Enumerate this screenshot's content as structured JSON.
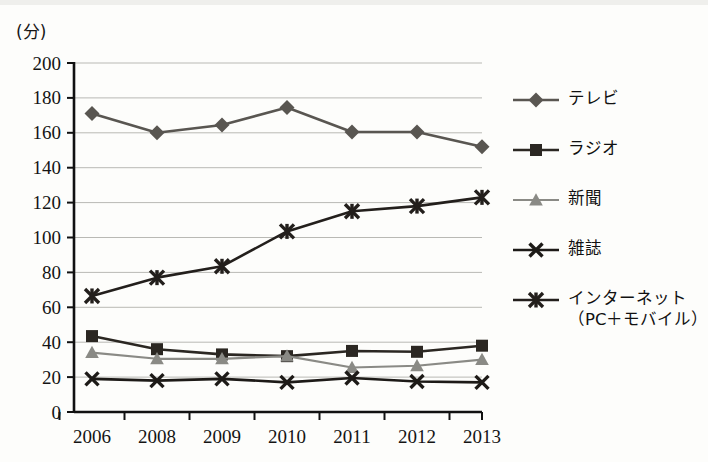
{
  "axis_unit_label": "(分)",
  "legend": {
    "items": [
      {
        "label": "テレビ",
        "sub_label": "",
        "marker": "diamond",
        "color": "#595651"
      },
      {
        "label": "ラジオ",
        "sub_label": "",
        "marker": "square",
        "color": "#2b2722"
      },
      {
        "label": "新聞",
        "sub_label": "",
        "marker": "triangle",
        "color": "#8a8a85"
      },
      {
        "label": "雑誌",
        "sub_label": "",
        "marker": "x-cross",
        "color": "#1d1a17"
      },
      {
        "label": "インターネット",
        "sub_label": "（PC＋モバイル）",
        "marker": "star-cross",
        "color": "#231f1c"
      }
    ]
  },
  "chart_data": {
    "type": "line",
    "title": "",
    "xlabel": "",
    "ylabel": "(分)",
    "categories": [
      "2006",
      "2008",
      "2009",
      "2010",
      "2011",
      "2012",
      "2013"
    ],
    "ylim": [
      0,
      200
    ],
    "ytick_step": 20,
    "yticks": [
      0,
      20,
      40,
      60,
      80,
      100,
      120,
      140,
      160,
      180,
      200
    ],
    "grid": true,
    "legend_position": "right",
    "series": [
      {
        "name": "テレビ",
        "color": "#595651",
        "marker": "diamond",
        "values": [
          171,
          160,
          164.5,
          174.5,
          160.5,
          160.5,
          152
        ]
      },
      {
        "name": "ラジオ",
        "color": "#2b2722",
        "marker": "square",
        "values": [
          43.5,
          36,
          33,
          32,
          35,
          34.5,
          38
        ]
      },
      {
        "name": "新聞",
        "color": "#8a8a85",
        "marker": "triangle",
        "values": [
          34,
          30.5,
          30.5,
          32,
          25.5,
          26.5,
          30
        ]
      },
      {
        "name": "雑誌",
        "color": "#1d1a17",
        "marker": "x-cross",
        "values": [
          19,
          18,
          19,
          17,
          19.5,
          17.5,
          17
        ]
      },
      {
        "name": "インターネット（PC＋モバイル）",
        "color": "#231f1c",
        "marker": "star-cross",
        "values": [
          66.5,
          77,
          83.5,
          103.5,
          115,
          118,
          123
        ]
      }
    ]
  }
}
